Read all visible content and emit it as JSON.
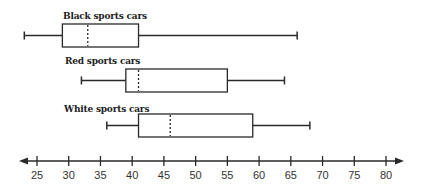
{
  "chart_data": {
    "type": "boxplot",
    "title": "",
    "xlabel": "",
    "ylabel": "",
    "orientation": "horizontal",
    "xlim": [
      24,
      82
    ],
    "ticks": [
      25,
      30,
      35,
      40,
      45,
      50,
      55,
      60,
      65,
      70,
      75,
      80
    ],
    "tick_labels": [
      "25",
      "30",
      "35",
      "40",
      "45",
      "50",
      "55",
      "60",
      "65",
      "70",
      "75",
      "80"
    ],
    "grid": false,
    "axis_arrows": true,
    "series": [
      {
        "name": "Black sports cars",
        "min": 23,
        "q1": 29,
        "median": 33,
        "q3": 41,
        "max": 66
      },
      {
        "name": "Red sports cars",
        "min": 32,
        "q1": 39,
        "median": 41,
        "q3": 55,
        "max": 64
      },
      {
        "name": "White sports cars",
        "min": 36,
        "q1": 41,
        "median": 46,
        "q3": 59,
        "max": 68
      }
    ]
  },
  "colors": {
    "line": "#2a2a2a",
    "background": "#ffffff"
  }
}
